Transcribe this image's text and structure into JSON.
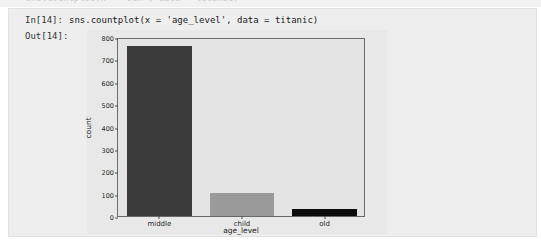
{
  "notebook": {
    "previous_cell_ghost_text": "sns.countplot(x = 'sex', data = titanic)",
    "input_prompt": "In[14]:",
    "output_prompt": "Out[14]:",
    "code": "sns.countplot(x = 'age_level', data = titanic)"
  },
  "chart_data": {
    "type": "bar",
    "title": "",
    "categories": [
      "middle",
      "child",
      "old"
    ],
    "values": [
      760,
      104,
      33
    ],
    "xlabel": "age_level",
    "ylabel": "count",
    "ylim": [
      0,
      800
    ],
    "yticks": [
      0,
      100,
      200,
      300,
      400,
      500,
      600,
      700,
      800
    ],
    "ytick_labels": [
      "0",
      "100",
      "200",
      "300",
      "400",
      "500",
      "600",
      "700",
      "800"
    ],
    "grid": false,
    "legend": null,
    "bar_colors": [
      "#3b3b3b",
      "#9a9a9a",
      "#0d0d0d"
    ],
    "plot_background": "#e4e4e4",
    "figure_background": "#e8e8e8"
  }
}
